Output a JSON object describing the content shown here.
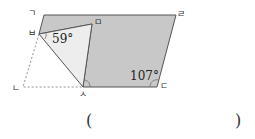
{
  "figure": {
    "vertices": {
      "top_left": "ㄱ",
      "bottom_left": "ㄴ",
      "bottom_right": "ㄷ",
      "top_right": "ㄹ",
      "folded_point": "ㅁ",
      "fold_top": "ㅂ",
      "fold_bottom": "ㅅ"
    },
    "angles": {
      "angle_at_fold_top": "59°",
      "angle_at_bottom_right": "107°"
    },
    "colors": {
      "shaded": "#c8c8c8",
      "folded_triangle": "#ededed",
      "stroke": "#555555"
    }
  },
  "answer": {
    "open_paren": "(",
    "close_paren": ")"
  }
}
